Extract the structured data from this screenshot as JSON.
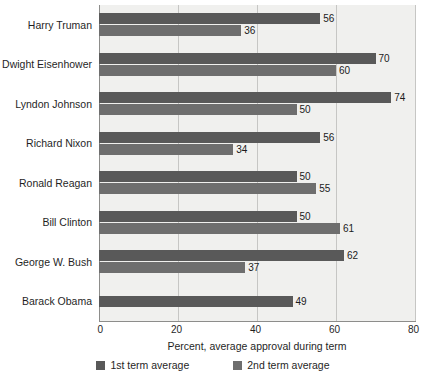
{
  "chart_data": {
    "type": "bar",
    "orientation": "horizontal",
    "title": "",
    "xlabel": "Percent, average approval during term",
    "ylabel": "",
    "xlim": [
      0,
      80
    ],
    "xticks": [
      0,
      20,
      40,
      60,
      80
    ],
    "grid": true,
    "legend_position": "bottom",
    "categories": [
      "Harry Truman",
      "Dwight Eisenhower",
      "Lyndon Johnson",
      "Richard Nixon",
      "Ronald Reagan",
      "Bill Clinton",
      "George W. Bush",
      "Barack Obama"
    ],
    "series": [
      {
        "name": "1st term average",
        "color": "#595959",
        "values": [
          56,
          70,
          74,
          56,
          50,
          50,
          62,
          49
        ]
      },
      {
        "name": "2nd term average",
        "color": "#6e6e6e",
        "values": [
          36,
          60,
          50,
          34,
          55,
          61,
          37,
          null
        ]
      }
    ]
  },
  "colors": {
    "series_1": "#595959",
    "series_2": "#6e6e6e",
    "plot_background": "#f0f0ee",
    "gridline": "#c6c6c4",
    "axis_line": "#8d8d8b"
  }
}
